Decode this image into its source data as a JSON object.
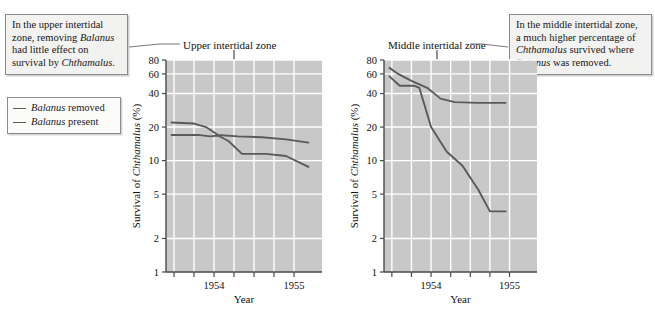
{
  "figure": {
    "callout_upper": {
      "lines": [
        "In the upper intertidal",
        "zone, removing Balanus",
        "had little effect on",
        "survival by Chthamalus."
      ],
      "text": "In the upper intertidal zone, removing Balanus had little effect on survival by Chthamalus."
    },
    "callout_middle": {
      "lines": [
        "In the middle intertidal zone,",
        "a much higher percentage of",
        "Chthamalus survived where",
        "Balanus was removed."
      ],
      "text": "In the middle intertidal zone, a much higher percentage of Chthamalus survived where Balanus was removed."
    },
    "legend": {
      "items": [
        {
          "species": "Balanus",
          "condition": "removed",
          "color": "#5a5a5a"
        },
        {
          "species": "Balanus",
          "condition": "present",
          "color": "#5a5a5a"
        }
      ]
    },
    "colors": {
      "plot_background": "#c8c8c8",
      "gridlines": "#ffffff",
      "axis": "#4a4a4a",
      "curve": "#5a5a5a",
      "callout_background": "#f2f2f0",
      "callout_border": "#8a8a8a"
    }
  },
  "chart_data": [
    {
      "type": "line",
      "id": "upper-intertidal-zone",
      "title": "Upper intertidal zone",
      "xlabel": "Year",
      "ylabel": "Survival of Chthamalus (%)",
      "yscale": "log",
      "ylim": [
        1,
        80
      ],
      "yticks": [
        1,
        2,
        5,
        10,
        20,
        40,
        60,
        80
      ],
      "ytick_labels": [
        "1",
        "2",
        "5",
        "10",
        "20",
        "40",
        "60",
        "80"
      ],
      "xlim": [
        1953.4,
        1955.35
      ],
      "xticks": [
        1953.5,
        1953.75,
        1954.0,
        1954.25,
        1954.5,
        1954.75,
        1955.0
      ],
      "xtick_labels": [
        "",
        "",
        "1954",
        "",
        "",
        "",
        "1955"
      ],
      "grid": true,
      "series": [
        {
          "name": "Balanus removed",
          "x": [
            1953.47,
            1953.75,
            1953.9,
            1954.05,
            1954.3,
            1954.6,
            1954.9,
            1955.18
          ],
          "y": [
            22,
            21.5,
            20,
            17,
            16.5,
            16.2,
            15.5,
            14.5
          ]
        },
        {
          "name": "Balanus present",
          "x": [
            1953.47,
            1953.8,
            1953.95,
            1954.05,
            1954.18,
            1954.35,
            1954.65,
            1954.9,
            1955.18
          ],
          "y": [
            17,
            17,
            16.5,
            16.8,
            15,
            11.5,
            11.5,
            11,
            8.8
          ]
        }
      ]
    },
    {
      "type": "line",
      "id": "middle-intertidal-zone",
      "title": "Middle intertidal zone",
      "xlabel": "Year",
      "ylabel": "Survival of Chthamalus (%)",
      "yscale": "log",
      "ylim": [
        1,
        80
      ],
      "yticks": [
        1,
        2,
        5,
        10,
        20,
        40,
        60,
        80
      ],
      "ytick_labels": [
        "1",
        "2",
        "5",
        "10",
        "20",
        "40",
        "60",
        "80"
      ],
      "xlim": [
        1953.4,
        1955.35
      ],
      "xticks": [
        1953.5,
        1953.75,
        1954.0,
        1954.25,
        1954.5,
        1954.75,
        1955.0
      ],
      "xtick_labels": [
        "",
        "",
        "1954",
        "",
        "",
        "",
        "1955"
      ],
      "grid": true,
      "series": [
        {
          "name": "Balanus removed",
          "x": [
            1953.47,
            1953.58,
            1953.75,
            1953.95,
            1954.12,
            1954.3,
            1954.6,
            1954.95
          ],
          "y": [
            68,
            60,
            52,
            45,
            36,
            33.5,
            33,
            33
          ]
        },
        {
          "name": "Balanus present",
          "x": [
            1953.47,
            1953.6,
            1953.78,
            1953.85,
            1954.0,
            1954.2,
            1954.4,
            1954.6,
            1954.75,
            1954.95
          ],
          "y": [
            57,
            47,
            47,
            45,
            20,
            12,
            9,
            5.5,
            3.5,
            3.5
          ]
        }
      ]
    }
  ]
}
